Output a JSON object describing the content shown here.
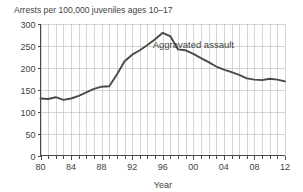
{
  "chart_data": {
    "type": "line",
    "title": "Arrests per 100,000 juveniles ages 10–17",
    "xlabel": "Year",
    "ylabel": "",
    "xlim": [
      1980,
      2012
    ],
    "ylim": [
      0,
      300
    ],
    "grid": true,
    "legend_position": "inline-annotation",
    "y_ticks": [
      0,
      50,
      100,
      150,
      200,
      250,
      300
    ],
    "y_tick_labels": [
      "0",
      "50",
      "100",
      "150",
      "200",
      "250",
      "300"
    ],
    "x_ticks": [
      1980,
      1984,
      1988,
      1992,
      1996,
      2000,
      2004,
      2008,
      2012
    ],
    "x_tick_labels": [
      "80",
      "84",
      "88",
      "92",
      "96",
      "00",
      "04",
      "08",
      "12"
    ],
    "x_minor_tick_interval": 1,
    "annotations": [
      {
        "text": "Aggravated assault",
        "x": 2000,
        "y": 245
      }
    ],
    "series": [
      {
        "name": "Aggravated assault",
        "color": "#4a4a4a",
        "x": [
          1980,
          1981,
          1982,
          1983,
          1984,
          1985,
          1986,
          1987,
          1988,
          1989,
          1990,
          1991,
          1992,
          1993,
          1994,
          1995,
          1996,
          1997,
          1998,
          1999,
          2000,
          2001,
          2002,
          2003,
          2004,
          2005,
          2006,
          2007,
          2008,
          2009,
          2010,
          2011,
          2012
        ],
        "values": [
          130,
          129,
          133,
          127,
          130,
          136,
          144,
          152,
          157,
          158,
          185,
          215,
          230,
          240,
          252,
          265,
          280,
          272,
          242,
          240,
          232,
          222,
          213,
          203,
          196,
          190,
          184,
          176,
          173,
          172,
          175,
          173,
          169
        ]
      }
    ]
  },
  "axes": {
    "y_axis_name": "y-axis",
    "x_axis_name": "x-axis"
  }
}
